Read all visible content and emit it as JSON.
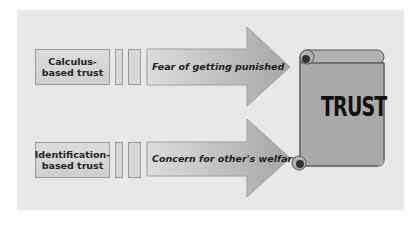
{
  "diagram": {
    "title": "",
    "background_color": "#e8e8e8",
    "rows": [
      {
        "label": "Calculus-\nbased trust",
        "label_line1": "Calculus-",
        "label_line2": "based trust",
        "arrow_text": "Fear of getting punished"
      },
      {
        "label": "Identification-\nbased trust",
        "label_line1": "Identification-",
        "label_line2": "based trust",
        "arrow_text": "Concern for other's welfare"
      }
    ],
    "target": {
      "icon": "scroll-icon",
      "label": "TRUST"
    },
    "colors": {
      "box_fill": "#d4d4d4",
      "arrow_fill_light": "#d9d9d9",
      "arrow_fill_dark": "#a8a8a8",
      "scroll_fill": "#a9a9a9",
      "border": "#9a9a9a",
      "text": "#1e1e1e"
    }
  }
}
